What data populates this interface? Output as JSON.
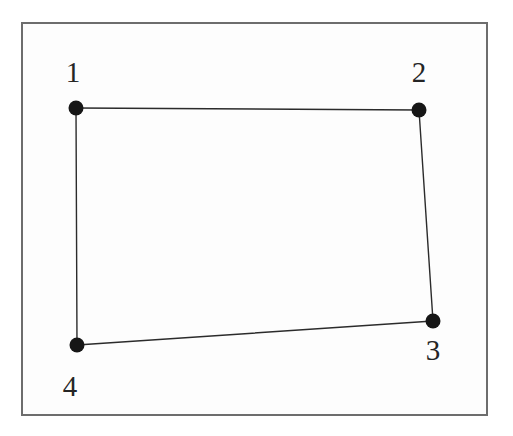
{
  "figure": {
    "canvas": {
      "width": 513,
      "height": 436
    },
    "background_color": "#ffffff",
    "frame": {
      "name": "figure-border",
      "x": 21,
      "y": 22,
      "width": 467,
      "height": 394,
      "stroke_color": "#6d6d6d",
      "stroke_width": 2,
      "fill_color": "#fdfdfd"
    },
    "style": {
      "edge_color": "#2b2b2b",
      "edge_width": 1.4,
      "vertex_color": "#161616",
      "vertex_radius": 7.5,
      "label_color": "#252525",
      "label_font_size": 29
    },
    "vertices": [
      {
        "id": 1,
        "label": "1",
        "x": 76,
        "y": 108,
        "label_x": 73,
        "label_y": 82
      },
      {
        "id": 2,
        "label": "2",
        "x": 419,
        "y": 110,
        "label_x": 419,
        "label_y": 82
      },
      {
        "id": 3,
        "label": "3",
        "x": 433,
        "y": 321,
        "label_x": 433,
        "label_y": 360
      },
      {
        "id": 4,
        "label": "4",
        "x": 77,
        "y": 345,
        "label_x": 70,
        "label_y": 396
      }
    ],
    "edges": [
      {
        "name": "edge-1-2",
        "from": 1,
        "to": 2
      },
      {
        "name": "edge-2-3",
        "from": 2,
        "to": 3
      },
      {
        "name": "edge-3-4",
        "from": 3,
        "to": 4
      },
      {
        "name": "edge-4-1",
        "from": 4,
        "to": 1
      }
    ]
  },
  "chart_data": {
    "type": "scatter",
    "xlabel": "",
    "ylabel": "",
    "xlim": [
      21,
      488
    ],
    "ylim": [
      22,
      416
    ],
    "grid": false,
    "legend": "none",
    "point_labels": [
      "1",
      "2",
      "3",
      "4"
    ],
    "x": [
      76,
      419,
      433,
      77
    ],
    "y": [
      108,
      110,
      321,
      345
    ],
    "annotations": [
      "Vertices connected in order 1-2-3-4-1 forming a closed quadrilateral",
      "Label 1 placed above-left of its point",
      "Label 2 placed above its point",
      "Label 3 placed below its point",
      "Label 4 placed below-left of its point"
    ]
  }
}
